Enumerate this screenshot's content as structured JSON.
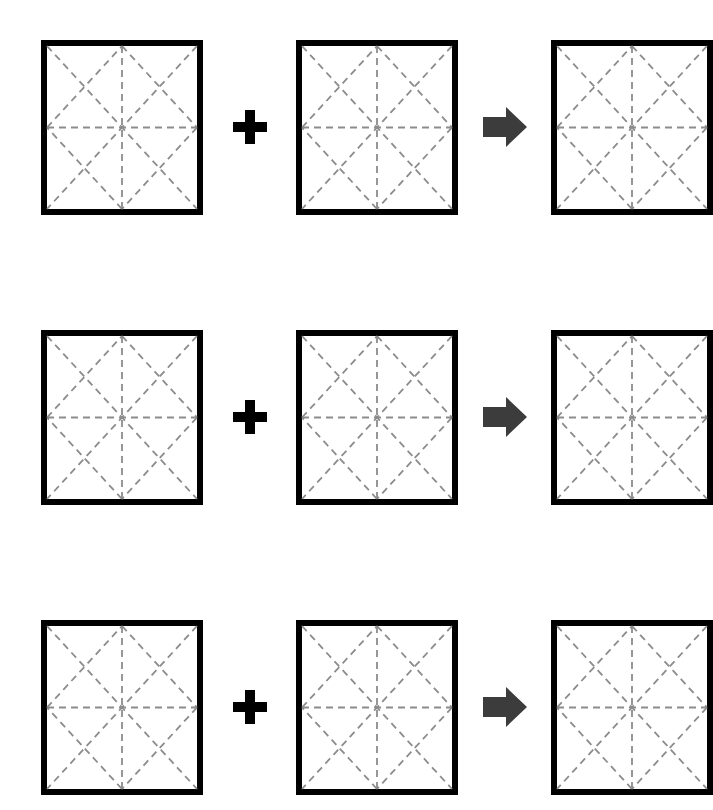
{
  "figure": {
    "background_color": "#ffffff",
    "width": 709,
    "height": 810,
    "row_count": 3,
    "operator_plus": "+",
    "operator_arrow": "➡",
    "plus_color": "#000000",
    "arrow_color": "#3c3c3c",
    "square_border_color": "#000000",
    "square_fill_color": "#ffffff",
    "crease_color": "#8c8c8c",
    "crease_style": "dashed"
  },
  "pattern_geometry": {
    "description": "Square with dashed creases: horizontal midline, vertical midline, both corner-to-corner diagonals, and a diamond joining the four edge midpoints",
    "creases": [
      "horizontal-midline",
      "vertical-midline",
      "diagonal-tl-br",
      "diagonal-tr-bl",
      "diamond-top-right",
      "diamond-right-bottom",
      "diamond-bottom-left",
      "diamond-left-top"
    ],
    "dash_length": 7,
    "dash_gap": 5,
    "crease_width": 1.8,
    "border_width": 6
  },
  "rows": [
    {
      "id": "row-1",
      "label": "Equation 1",
      "left_operand": {
        "name": "crease-pattern-a1",
        "label": "Pattern A"
      },
      "plus": "+",
      "right_operand": {
        "name": "crease-pattern-b1",
        "label": "Pattern B"
      },
      "arrow": "➡",
      "result": {
        "name": "crease-pattern-c1",
        "label": "Pattern C"
      }
    },
    {
      "id": "row-2",
      "label": "Equation 2",
      "left_operand": {
        "name": "crease-pattern-a2",
        "label": "Pattern A"
      },
      "plus": "+",
      "right_operand": {
        "name": "crease-pattern-b2",
        "label": "Pattern B"
      },
      "arrow": "➡",
      "result": {
        "name": "crease-pattern-c2",
        "label": "Pattern C"
      }
    },
    {
      "id": "row-3",
      "label": "Equation 3",
      "left_operand": {
        "name": "crease-pattern-a3",
        "label": "Pattern A"
      },
      "plus": "+",
      "right_operand": {
        "name": "crease-pattern-b3",
        "label": "Pattern B"
      },
      "arrow": "➡",
      "result": {
        "name": "crease-pattern-c3",
        "label": "Pattern C"
      }
    }
  ]
}
